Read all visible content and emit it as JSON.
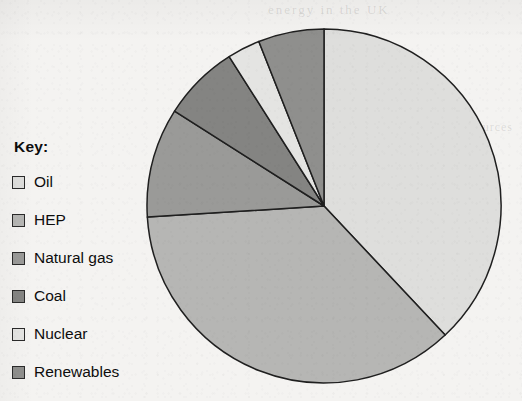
{
  "legend": {
    "title": "Key:",
    "items": [
      {
        "label": "Oil",
        "color": "#dededc",
        "swatch_name": "legend-swatch-oil"
      },
      {
        "label": "HEP",
        "color": "#b6b6b4",
        "swatch_name": "legend-swatch-hep"
      },
      {
        "label": "Natural gas",
        "color": "#9a9a98",
        "swatch_name": "legend-swatch-natural-gas"
      },
      {
        "label": "Coal",
        "color": "#848482",
        "swatch_name": "legend-swatch-coal"
      },
      {
        "label": "Nuclear",
        "color": "#e4e4e2",
        "swatch_name": "legend-swatch-nuclear"
      },
      {
        "label": "Renewables",
        "color": "#8f8f8d",
        "swatch_name": "legend-swatch-renewables"
      }
    ]
  },
  "bleedthrough": {
    "top": "energy in the UK",
    "middle": "of renewable",
    "right": "sources"
  },
  "chart_data": {
    "type": "pie",
    "title": "",
    "categories": [
      "Oil",
      "HEP",
      "Natural gas",
      "Coal",
      "Nuclear",
      "Renewables"
    ],
    "values": [
      38,
      36,
      10,
      7,
      3,
      6
    ],
    "unit": "%",
    "start_angle_deg": 0,
    "direction": "clockwise",
    "center": {
      "x": 179,
      "y": 179
    },
    "radius": 177,
    "colors": [
      "#dededc",
      "#b6b6b4",
      "#9a9a98",
      "#848482",
      "#e4e4e2",
      "#8f8f8d"
    ],
    "stroke": "#1f1f1f",
    "legend_position": "left",
    "data_labels": false,
    "grid": false
  }
}
